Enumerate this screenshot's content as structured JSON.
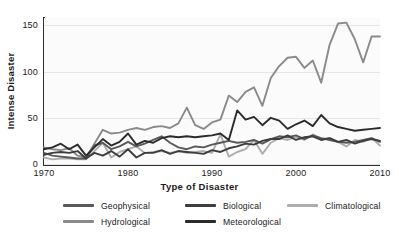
{
  "chart_data": {
    "type": "line",
    "title": "",
    "xlabel": "Type of Disaster",
    "ylabel": "Intense Disaster",
    "xlim": [
      1970,
      2010
    ],
    "ylim": [
      0,
      158
    ],
    "grid": true,
    "legend_position": "bottom",
    "xticks": [
      1970,
      1980,
      1990,
      2000,
      2010
    ],
    "yticks": [
      0,
      50,
      100,
      150
    ],
    "x": [
      1970,
      1971,
      1972,
      1973,
      1974,
      1975,
      1976,
      1977,
      1978,
      1979,
      1980,
      1981,
      1982,
      1983,
      1984,
      1985,
      1986,
      1987,
      1988,
      1989,
      1990,
      1991,
      1992,
      1993,
      1994,
      1995,
      1996,
      1997,
      1998,
      1999,
      2000,
      2001,
      2002,
      2003,
      2004,
      2005,
      2006,
      2007,
      2008,
      2009,
      2010
    ],
    "series": [
      {
        "name": "Geophysical",
        "color": "#595959",
        "values": [
          12,
          9,
          8,
          7,
          6,
          6,
          20,
          23,
          16,
          19,
          24,
          19,
          22,
          26,
          30,
          23,
          18,
          16,
          19,
          18,
          21,
          23,
          25,
          23,
          24,
          26,
          22,
          27,
          30,
          29,
          31,
          27,
          31,
          28,
          26,
          24,
          23,
          24,
          26,
          28,
          24
        ]
      },
      {
        "name": "Hydrological",
        "color": "#8a8a8a",
        "values": [
          18,
          16,
          15,
          17,
          9,
          7,
          22,
          37,
          33,
          34,
          37,
          39,
          37,
          40,
          41,
          39,
          44,
          61,
          42,
          38,
          45,
          48,
          74,
          67,
          78,
          83,
          63,
          93,
          106,
          115,
          116,
          104,
          112,
          88,
          129,
          152,
          153,
          135,
          110,
          138,
          138
        ]
      },
      {
        "name": "Biological",
        "color": "#3d3d3d",
        "values": [
          10,
          12,
          13,
          12,
          14,
          6,
          12,
          9,
          14,
          8,
          16,
          7,
          12,
          12,
          15,
          11,
          14,
          13,
          12,
          11,
          15,
          13,
          17,
          19,
          22,
          21,
          25,
          27,
          27,
          31,
          26,
          29,
          30,
          26,
          28,
          24,
          26,
          22,
          25,
          27,
          25
        ]
      },
      {
        "name": "Meteorological",
        "color": "#2b2b2b",
        "values": [
          16,
          18,
          22,
          16,
          21,
          9,
          18,
          27,
          20,
          24,
          33,
          21,
          25,
          23,
          28,
          30,
          29,
          30,
          29,
          30,
          31,
          33,
          26,
          58,
          48,
          51,
          42,
          50,
          47,
          38,
          43,
          47,
          41,
          53,
          44,
          40,
          38,
          36,
          37,
          38,
          39
        ]
      },
      {
        "name": "Climatological",
        "color": "#adadad",
        "values": [
          7,
          5,
          6,
          6,
          5,
          5,
          14,
          23,
          7,
          13,
          16,
          19,
          12,
          13,
          14,
          12,
          14,
          12,
          13,
          14,
          12,
          32,
          8,
          13,
          16,
          26,
          11,
          23,
          28,
          26,
          29,
          26,
          32,
          27,
          28,
          24,
          19,
          26,
          24,
          28,
          20
        ]
      }
    ]
  },
  "axes": {
    "ylabel": "Intense Disaster",
    "xlabel": "Type of Disaster",
    "ytick_labels": [
      "0",
      "50",
      "100",
      "150"
    ],
    "xtick_labels": [
      "1970",
      "1980",
      "1990",
      "2000",
      "2010"
    ]
  },
  "legend": {
    "columns": [
      {
        "items": [
          {
            "label": "Geophysical",
            "color": "#595959"
          },
          {
            "label": "Hydrological",
            "color": "#8a8a8a"
          }
        ]
      },
      {
        "items": [
          {
            "label": "Biological",
            "color": "#3d3d3d"
          },
          {
            "label": "Meteorological",
            "color": "#2b2b2b"
          }
        ]
      },
      {
        "items": [
          {
            "label": "Climatological",
            "color": "#adadad"
          }
        ]
      }
    ]
  }
}
